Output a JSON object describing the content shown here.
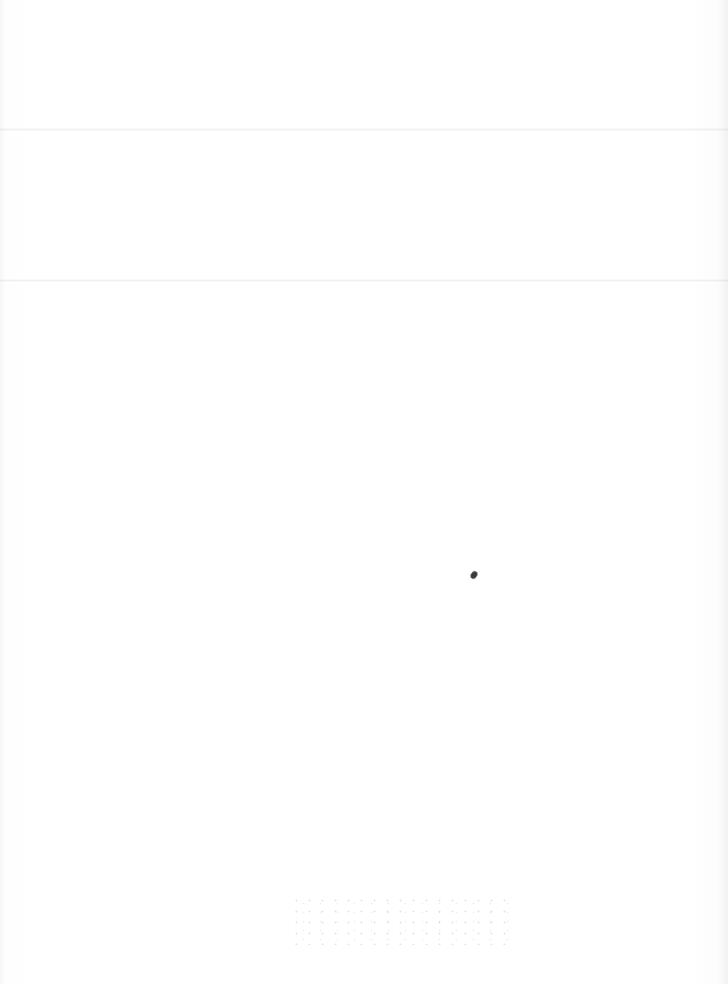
{
  "document": {
    "type": "blank-scanned-page",
    "text": "",
    "fold_lines": 2,
    "colors": {
      "paper": "#fdfdfd",
      "fold": "#e6e6e6",
      "speck": "#3a3a3a"
    }
  }
}
